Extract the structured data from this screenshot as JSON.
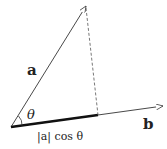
{
  "diagram": {
    "labels": {
      "vector_a": "a",
      "vector_b": "b",
      "angle": "θ",
      "projection": "|a| cos θ"
    },
    "points": {
      "origin": [
        11,
        127
      ],
      "a_tip": [
        86,
        6
      ],
      "projection_foot": [
        98,
        115
      ],
      "b_tip": [
        163,
        106
      ]
    },
    "colors": {
      "line": "#333333",
      "projection": "#111111",
      "dashed": "#555555"
    }
  }
}
